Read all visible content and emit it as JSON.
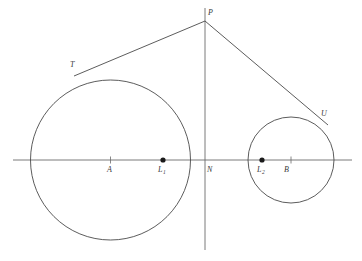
{
  "figure": {
    "background_color": "#ffffff",
    "stroke_color": "#4a4a4a",
    "axis_color": "#6b6b6b",
    "label_color": "#3a3a3a",
    "width": 362,
    "height": 261
  },
  "axes": {
    "horizontal": {
      "name": "horizontal-axis",
      "x1": 13,
      "y1": 160,
      "x2": 352,
      "y2": 160
    },
    "vertical": {
      "name": "vertical-axis",
      "x1": 205,
      "y1": 8,
      "x2": 205,
      "y2": 250
    }
  },
  "circles": [
    {
      "name": "large-circle",
      "cx": 110.5,
      "cy": 160,
      "r": 80,
      "center_label": "A"
    },
    {
      "name": "small-circle",
      "cx": 291,
      "cy": 160,
      "r": 43,
      "center_label": "B"
    }
  ],
  "tangent_lines": [
    {
      "name": "tangent-line-PT",
      "x1": 205,
      "y1": 21,
      "x2": 74,
      "y2": 76
    },
    {
      "name": "tangent-line-PU",
      "x1": 205,
      "y1": 21,
      "x2": 328,
      "y2": 125
    }
  ],
  "tick_marks": [
    {
      "name": "tick-A",
      "x": 110.5,
      "y": 160
    },
    {
      "name": "tick-B",
      "x": 291,
      "y": 160
    }
  ],
  "marked_points": [
    {
      "name": "point-L1",
      "x": 163,
      "y": 160,
      "filled": true
    },
    {
      "name": "point-L2",
      "x": 262,
      "y": 160,
      "filled": true
    }
  ],
  "labels": {
    "apex": {
      "text": "P",
      "x": 208,
      "y": 9
    },
    "tangent_point_left": {
      "text": "T",
      "x": 70,
      "y": 61
    },
    "tangent_point_right": {
      "text": "U",
      "x": 321,
      "y": 110
    },
    "center_large": {
      "text": "A",
      "x": 107,
      "y": 166
    },
    "focus_left": {
      "text": "L",
      "sub": "1",
      "x": 158,
      "y": 166
    },
    "origin": {
      "text": "N",
      "x": 207,
      "y": 166
    },
    "focus_right": {
      "text": "L",
      "sub": "2",
      "x": 257,
      "y": 166
    },
    "center_small": {
      "text": "B",
      "x": 284,
      "y": 166
    }
  }
}
